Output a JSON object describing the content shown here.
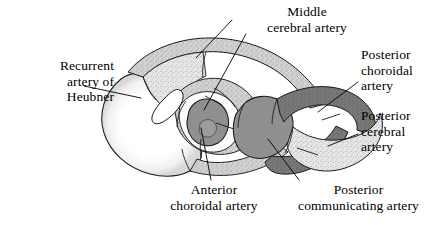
{
  "figure": {
    "background_color": "#ffffff",
    "ink_color": "#000000",
    "width": 437,
    "height": 225
  },
  "labels": {
    "recurrent_artery_of_heubner": {
      "name": "Recurrent artery of Heubner",
      "lines": [
        "Recurrent",
        "artery of",
        "Heubner"
      ],
      "align": "right"
    },
    "middle_cerebral_artery": {
      "name": "Middle cerebral artery",
      "lines": [
        "Middle",
        "cerebral artery"
      ],
      "align": "center"
    },
    "posterior_choroidal_artery": {
      "name": "Posterior choroidal artery",
      "lines": [
        "Posterior",
        "choroidal",
        "artery"
      ],
      "align": "left"
    },
    "posterior_cerebral_artery": {
      "name": "Posterior cerebral artery",
      "lines": [
        "Posterior",
        "cerebral",
        "artery"
      ],
      "align": "left"
    },
    "anterior_choroidal_artery": {
      "name": "Anterior choroidal artery",
      "lines": [
        "Anterior",
        "choroidal artery"
      ],
      "align": "center"
    },
    "posterior_communicating_artery": {
      "name": "Posterior communicating artery",
      "lines": [
        "Posterior",
        "communicating artery"
      ],
      "align": "center"
    }
  },
  "territories": [
    {
      "key": "recurrent_artery_of_heubner",
      "label": "Recurrent artery of Heubner",
      "shade": "white-stippled",
      "fill_color": "#ffffff"
    },
    {
      "key": "middle_cerebral_artery",
      "label": "Middle cerebral artery",
      "shade": "light-gray-stippled",
      "fill_color": "#dcdcdc"
    },
    {
      "key": "anterior_choroidal_artery",
      "label": "Anterior choroidal artery",
      "shade": "dark-gray",
      "fill_color": "#8f8f8f"
    },
    {
      "key": "posterior_communicating_artery",
      "label": "Posterior communicating artery",
      "shade": "dark-gray",
      "fill_color": "#8f8f8f"
    },
    {
      "key": "posterior_choroidal_artery",
      "label": "Posterior choroidal artery",
      "shade": "darker-gray-stippled",
      "fill_color": "#757575"
    },
    {
      "key": "posterior_cerebral_artery",
      "label": "Posterior cerebral artery",
      "shade": "light-gray-stippled",
      "fill_color": "#e3e3e3"
    }
  ]
}
